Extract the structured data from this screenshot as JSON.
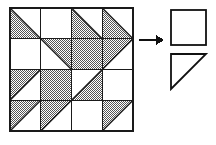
{
  "figure": {
    "type": "geometric-pattern-diagram"
  },
  "quilt": {
    "name": "quilt-grid",
    "rows": 4,
    "cols": 4,
    "x": 10,
    "y": 8,
    "cell_size": 30.75,
    "border_color": "#1a1a1a",
    "border_width": 1.6,
    "grid_line_color": "#1a1a1a",
    "grid_line_width": 1.4,
    "fill_color": "#8c8c8c",
    "background_color": "#ffffff",
    "cells": [
      {
        "row": 0,
        "col": 0,
        "fill": "lower-left",
        "label": "triangle-lower-left"
      },
      {
        "row": 0,
        "col": 1,
        "fill": "empty",
        "label": "empty-square"
      },
      {
        "row": 0,
        "col": 2,
        "fill": "lower-left",
        "label": "triangle-lower-left"
      },
      {
        "row": 0,
        "col": 3,
        "fill": "lower-left",
        "label": "triangle-lower-left"
      },
      {
        "row": 1,
        "col": 0,
        "fill": "empty",
        "label": "empty-square"
      },
      {
        "row": 1,
        "col": 1,
        "fill": "upper-right",
        "label": "triangle-upper-right"
      },
      {
        "row": 1,
        "col": 2,
        "fill": "full",
        "label": "full-shaded-square"
      },
      {
        "row": 1,
        "col": 3,
        "fill": "upper-left",
        "label": "triangle-upper-left"
      },
      {
        "row": 2,
        "col": 0,
        "fill": "upper-left",
        "label": "triangle-upper-left"
      },
      {
        "row": 2,
        "col": 1,
        "fill": "full",
        "label": "full-shaded-square"
      },
      {
        "row": 2,
        "col": 2,
        "fill": "lower-right",
        "label": "triangle-lower-right"
      },
      {
        "row": 2,
        "col": 3,
        "fill": "empty",
        "label": "empty-square"
      },
      {
        "row": 3,
        "col": 0,
        "fill": "upper-left",
        "label": "triangle-upper-left"
      },
      {
        "row": 3,
        "col": 1,
        "fill": "upper-left",
        "label": "triangle-upper-left"
      },
      {
        "row": 3,
        "col": 2,
        "fill": "empty",
        "label": "empty-square"
      },
      {
        "row": 3,
        "col": 3,
        "fill": "upper-left",
        "label": "triangle-upper-left"
      }
    ]
  },
  "arrow": {
    "name": "right-arrow-icon",
    "direction": "right",
    "x1": 139,
    "y1": 40,
    "x2": 164,
    "y2": 40,
    "color": "#111111",
    "line_width": 2.2,
    "head_length": 8,
    "head_half_width": 5
  },
  "legend": {
    "name": "unit-shapes",
    "shapes": [
      {
        "name": "unit-square",
        "type": "square",
        "x": 171,
        "y": 10,
        "size": 35,
        "fill": "none",
        "stroke": "#111111",
        "stroke_width": 1.8
      },
      {
        "name": "unit-triangle",
        "type": "triangle",
        "orientation": "right-angle-top-left",
        "x": 171,
        "y": 54,
        "size": 35,
        "fill": "none",
        "stroke": "#111111",
        "stroke_width": 1.8
      }
    ]
  }
}
